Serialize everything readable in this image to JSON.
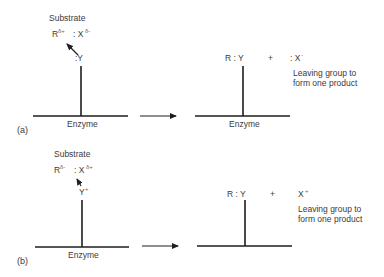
{
  "diagram": {
    "type": "enzyme-substrate mechanism",
    "panels": [
      {
        "label": "(a)",
        "reactant": {
          "title": "Substrate",
          "R": "R",
          "R_charge": "δ+",
          "X": ": X",
          "X_charge": "δ-",
          "nucleophile": ":Y",
          "enzyme_label": "Enzyme"
        },
        "product": {
          "bonded": "R : Y",
          "plus": "+",
          "leaving": ": X",
          "leaving_charge": "-",
          "note_line1": "Leaving group to",
          "note_line2": "form one product",
          "enzyme_label": "Enzyme"
        }
      },
      {
        "label": "(b)",
        "reactant": {
          "title": "Substrate",
          "R": "R",
          "R_charge": "δ-",
          "X": ": X",
          "X_charge": "δ+",
          "nucleophile": "Y",
          "nucleophile_charge": "+",
          "enzyme_label": "Enzyme"
        },
        "product": {
          "bonded": "R : Y",
          "plus": "+",
          "leaving": "X",
          "leaving_charge": "+",
          "note_line1": "Leaving group to",
          "note_line2": "form one product"
        }
      }
    ]
  },
  "colors": {
    "ink": "#1e1e1e",
    "text": "#3a3a3a",
    "background": "#ffffff"
  }
}
